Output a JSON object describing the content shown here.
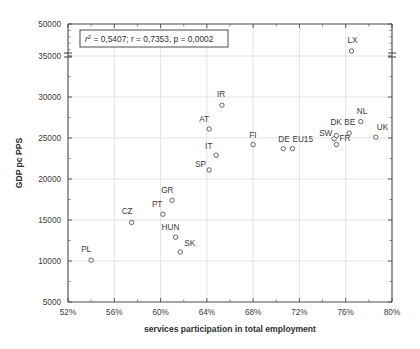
{
  "chart_data": {
    "type": "scatter",
    "title": "",
    "xlabel": "services participation in total employment",
    "ylabel": "GDP pc PPS",
    "xlim": [
      52,
      80
    ],
    "ylim": [
      5000,
      50000
    ],
    "xticks": [
      "52%",
      "56%",
      "60%",
      "64%",
      "68%",
      "72%",
      "76%",
      "80%"
    ],
    "xtick_values": [
      52,
      56,
      60,
      64,
      68,
      72,
      76,
      80
    ],
    "yticks": [
      "5000",
      "10000",
      "15000",
      "20000",
      "25000",
      "30000",
      "35000",
      "50000"
    ],
    "ytick_values": [
      5000,
      10000,
      15000,
      20000,
      25000,
      30000,
      35000,
      50000
    ],
    "y_axis_break": {
      "between": [
        35000,
        50000
      ],
      "note": "axis break drawn above 35000"
    },
    "grid": true,
    "legend": false,
    "annotation": "r2 = 0,5407;   r = 0,7353, p = 0,0002",
    "annotation_parts": {
      "r_squared_symbol": "r",
      "r_squared_exponent": "2",
      "r_squared_value": "= 0,5407;",
      "r_label": "r = 0,7353,",
      "p_label": "p = 0,0002"
    },
    "points": [
      {
        "label": "PL",
        "x": 54.0,
        "y": 10100,
        "lx": -10,
        "ly": -8
      },
      {
        "label": "CZ",
        "x": 57.5,
        "y": 14700,
        "lx": -10,
        "ly": -8
      },
      {
        "label": "PT",
        "x": 60.2,
        "y": 15700,
        "lx": -11,
        "ly": -7
      },
      {
        "label": "GR",
        "x": 61.0,
        "y": 17400,
        "lx": -11,
        "ly": -7
      },
      {
        "label": "HUN",
        "x": 61.3,
        "y": 12900,
        "lx": -14,
        "ly": -7
      },
      {
        "label": "SK",
        "x": 61.7,
        "y": 11100,
        "lx": 4,
        "ly": -6
      },
      {
        "label": "SP",
        "x": 64.2,
        "y": 21100,
        "lx": -14,
        "ly": -3
      },
      {
        "label": "IT",
        "x": 64.8,
        "y": 22900,
        "lx": -11,
        "ly": -6
      },
      {
        "label": "AT",
        "x": 64.2,
        "y": 26100,
        "lx": -10,
        "ly": -7
      },
      {
        "label": "IR",
        "x": 65.3,
        "y": 29000,
        "lx": -5,
        "ly": -8
      },
      {
        "label": "FI",
        "x": 68.0,
        "y": 24200,
        "lx": -4,
        "ly": -7
      },
      {
        "label": "DE",
        "x": 70.6,
        "y": 23700,
        "lx": -5,
        "ly": -7
      },
      {
        "label": "EU15",
        "x": 71.4,
        "y": 23700,
        "lx": 0,
        "ly": -7
      },
      {
        "label": "SW",
        "x": 75.0,
        "y": 24900,
        "lx": -15,
        "ly": -3
      },
      {
        "label": "DK",
        "x": 75.2,
        "y": 25300,
        "lx": -6,
        "ly": -11
      },
      {
        "label": "FR",
        "x": 75.2,
        "y": 24200,
        "lx": 3,
        "ly": -4
      },
      {
        "label": "BE",
        "x": 76.3,
        "y": 25600,
        "lx": -5,
        "ly": -8
      },
      {
        "label": "NL",
        "x": 77.3,
        "y": 27000,
        "lx": -4,
        "ly": -8
      },
      {
        "label": "UK",
        "x": 78.6,
        "y": 25100,
        "lx": 1,
        "ly": -7
      },
      {
        "label": "LX",
        "x": 76.5,
        "y": 37300,
        "lx": -4,
        "ly": -8
      }
    ]
  }
}
